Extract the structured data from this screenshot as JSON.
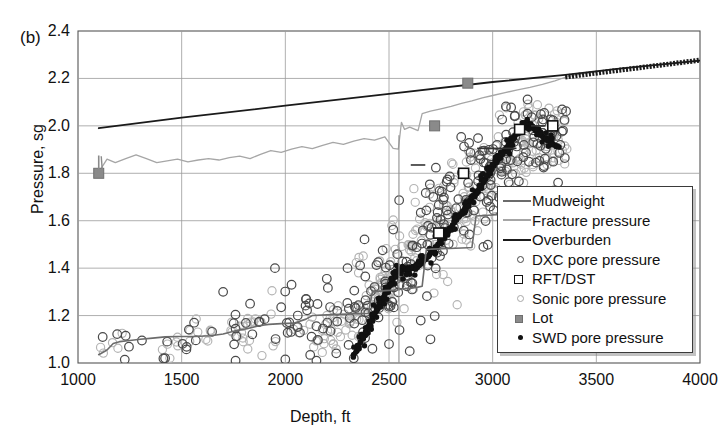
{
  "panel": {
    "label": "(b)"
  },
  "chart_data": {
    "type": "scatter",
    "title": "",
    "xlabel": "Depth, ft",
    "ylabel": "Pressure, sg",
    "xlim": [
      1000,
      4000
    ],
    "ylim": [
      1.0,
      2.4
    ],
    "xticks": [
      1000,
      1500,
      2000,
      2500,
      3000,
      3500,
      4000
    ],
    "yticks": [
      "1.0",
      "1.2",
      "1.4",
      "1.6",
      "1.8",
      "2.0",
      "2.2",
      "2.4"
    ],
    "grid": true,
    "legend_position": "center-right",
    "legend": [
      {
        "label": "Mudweight",
        "kind": "line",
        "color": "#6b6b6b"
      },
      {
        "label": "Fracture pressure",
        "kind": "line",
        "color": "#a6a6a6"
      },
      {
        "label": "Overburden",
        "kind": "line",
        "color": "#1a1a1a"
      },
      {
        "label": "DXC pore pressure",
        "kind": "open-circle",
        "color": "#444444"
      },
      {
        "label": "RFT/DST",
        "kind": "open-square",
        "color": "#111111"
      },
      {
        "label": "Sonic pore pressure",
        "kind": "open-circle-light",
        "color": "#a8a8a8"
      },
      {
        "label": "Lot",
        "kind": "filled-square",
        "color": "#8a8a8a"
      },
      {
        "label": "SWD pore pressure",
        "kind": "filled-dot",
        "color": "#111111"
      }
    ],
    "series": [
      {
        "name": "Overburden",
        "type": "line",
        "color": "#1a1a1a",
        "points": [
          [
            1100,
            1.99
          ],
          [
            1500,
            2.035
          ],
          [
            2000,
            2.085
          ],
          [
            2500,
            2.135
          ],
          [
            3000,
            2.185
          ],
          [
            3350,
            2.215
          ],
          [
            3600,
            2.24
          ],
          [
            4000,
            2.275
          ]
        ]
      },
      {
        "name": "Fracture pressure",
        "type": "line",
        "color": "#a6a6a6",
        "points": [
          [
            1100,
            1.805
          ],
          [
            1140,
            1.86
          ],
          [
            1180,
            1.845
          ],
          [
            1230,
            1.862
          ],
          [
            1280,
            1.878
          ],
          [
            1330,
            1.862
          ],
          [
            1380,
            1.845
          ],
          [
            1430,
            1.852
          ],
          [
            1480,
            1.86
          ],
          [
            1530,
            1.848
          ],
          [
            1580,
            1.856
          ],
          [
            1630,
            1.862
          ],
          [
            1680,
            1.856
          ],
          [
            1730,
            1.866
          ],
          [
            1780,
            1.872
          ],
          [
            1830,
            1.862
          ],
          [
            1880,
            1.88
          ],
          [
            1930,
            1.896
          ],
          [
            1980,
            1.888
          ],
          [
            2030,
            1.902
          ],
          [
            2080,
            1.912
          ],
          [
            2130,
            1.904
          ],
          [
            2180,
            1.918
          ],
          [
            2230,
            1.93
          ],
          [
            2280,
            1.922
          ],
          [
            2330,
            1.936
          ],
          [
            2380,
            1.946
          ],
          [
            2430,
            1.94
          ],
          [
            2480,
            1.954
          ],
          [
            2520,
            1.905
          ],
          [
            2545,
            1.902
          ],
          [
            2560,
            2.015
          ],
          [
            2575,
            1.985
          ],
          [
            2600,
            1.995
          ],
          [
            2640,
            1.98
          ],
          [
            2660,
            2.052
          ],
          [
            2700,
            2.062
          ],
          [
            2750,
            2.072
          ],
          [
            2800,
            2.082
          ],
          [
            2850,
            2.095
          ],
          [
            2900,
            2.105
          ],
          [
            2950,
            2.118
          ],
          [
            3000,
            2.128
          ],
          [
            3060,
            2.14
          ],
          [
            3120,
            2.152
          ],
          [
            3180,
            2.162
          ],
          [
            3240,
            2.175
          ],
          [
            3300,
            2.19
          ],
          [
            3350,
            2.205
          ],
          [
            3400,
            2.215
          ],
          [
            3500,
            2.228
          ],
          [
            3600,
            2.24
          ],
          [
            3700,
            2.25
          ],
          [
            3800,
            2.258
          ],
          [
            3900,
            2.268
          ],
          [
            4000,
            2.276
          ]
        ]
      },
      {
        "name": "Mudweight",
        "type": "line",
        "color": "#6b6b6b",
        "points": [
          [
            1100,
            1.035
          ],
          [
            1140,
            1.055
          ],
          [
            1170,
            1.082
          ],
          [
            1200,
            1.09
          ],
          [
            1250,
            1.095
          ],
          [
            1300,
            1.1
          ],
          [
            1360,
            1.105
          ],
          [
            1420,
            1.11
          ],
          [
            1480,
            1.112
          ],
          [
            1560,
            1.112
          ],
          [
            1640,
            1.115
          ],
          [
            1700,
            1.122
          ],
          [
            1760,
            1.136
          ],
          [
            1800,
            1.142
          ],
          [
            1840,
            1.15
          ],
          [
            1880,
            1.158
          ],
          [
            1920,
            1.163
          ],
          [
            1980,
            1.166
          ],
          [
            2040,
            1.168
          ],
          [
            2100,
            1.185
          ],
          [
            2130,
            1.2
          ],
          [
            2200,
            1.203
          ],
          [
            2260,
            1.205
          ],
          [
            2300,
            1.206
          ],
          [
            2350,
            1.208
          ],
          [
            2400,
            1.209
          ],
          [
            2420,
            1.3
          ],
          [
            2480,
            1.305
          ],
          [
            2540,
            1.308
          ],
          [
            2560,
            1.312
          ],
          [
            2600,
            1.314
          ],
          [
            2640,
            1.32
          ],
          [
            2660,
            1.324
          ],
          [
            2680,
            1.478
          ],
          [
            2700,
            1.48
          ],
          [
            2760,
            1.482
          ],
          [
            2820,
            1.484
          ],
          [
            2880,
            1.486
          ],
          [
            2900,
            1.487
          ],
          [
            2920,
            1.62
          ],
          [
            2960,
            1.622
          ],
          [
            3000,
            1.624
          ],
          [
            3040,
            1.626
          ],
          [
            3080,
            1.628
          ],
          [
            3120,
            1.63
          ],
          [
            3160,
            1.632
          ],
          [
            3200,
            1.633
          ],
          [
            3240,
            1.634
          ],
          [
            3280,
            1.636
          ],
          [
            3320,
            1.637
          ]
        ]
      },
      {
        "name": "Lot",
        "type": "filled-square",
        "color": "#8a8a8a",
        "points": [
          [
            1100,
            1.8
          ],
          [
            2720,
            2.0
          ],
          [
            2880,
            2.18
          ]
        ]
      },
      {
        "name": "RFT/DST",
        "type": "open-square",
        "color": "#111111",
        "points": [
          [
            2740,
            1.548
          ],
          [
            2860,
            1.8
          ],
          [
            3130,
            1.985
          ],
          [
            3290,
            2.0
          ]
        ]
      },
      {
        "name": "SWD pore pressure",
        "type": "filled-dot",
        "color": "#111111",
        "points": [
          [
            2330,
            1.035
          ],
          [
            2345,
            1.052
          ],
          [
            2355,
            1.07
          ],
          [
            2362,
            1.088
          ],
          [
            2370,
            1.105
          ],
          [
            2380,
            1.118
          ],
          [
            2390,
            1.132
          ],
          [
            2398,
            1.148
          ],
          [
            2405,
            1.162
          ],
          [
            2415,
            1.178
          ],
          [
            2422,
            1.192
          ],
          [
            2430,
            1.205
          ],
          [
            2438,
            1.218
          ],
          [
            2446,
            1.228
          ],
          [
            2452,
            1.24
          ],
          [
            2460,
            1.252
          ],
          [
            2468,
            1.265
          ],
          [
            2476,
            1.28
          ],
          [
            2484,
            1.295
          ],
          [
            2492,
            1.31
          ],
          [
            2500,
            1.322
          ],
          [
            2508,
            1.335
          ],
          [
            2516,
            1.348
          ],
          [
            2522,
            1.36
          ],
          [
            2530,
            1.372
          ],
          [
            2538,
            1.385
          ],
          [
            2546,
            1.392
          ],
          [
            2556,
            1.386
          ],
          [
            2566,
            1.392
          ],
          [
            2576,
            1.4
          ],
          [
            2586,
            1.395
          ],
          [
            2596,
            1.39
          ],
          [
            2606,
            1.398
          ],
          [
            2616,
            1.406
          ],
          [
            2626,
            1.398
          ],
          [
            2636,
            1.404
          ],
          [
            2646,
            1.412
          ],
          [
            2656,
            1.42
          ],
          [
            2666,
            1.43
          ],
          [
            2676,
            1.438
          ],
          [
            2686,
            1.448
          ],
          [
            2696,
            1.458
          ],
          [
            2706,
            1.468
          ],
          [
            2716,
            1.478
          ],
          [
            2726,
            1.488
          ],
          [
            2736,
            1.5
          ],
          [
            2746,
            1.512
          ],
          [
            2756,
            1.522
          ],
          [
            2766,
            1.534
          ],
          [
            2776,
            1.545
          ],
          [
            2786,
            1.556
          ],
          [
            2796,
            1.568
          ],
          [
            2806,
            1.58
          ],
          [
            2816,
            1.592
          ],
          [
            2826,
            1.604
          ],
          [
            2836,
            1.616
          ],
          [
            2846,
            1.628
          ],
          [
            2856,
            1.64
          ],
          [
            2866,
            1.652
          ],
          [
            2876,
            1.664
          ],
          [
            2886,
            1.678
          ],
          [
            2896,
            1.69
          ],
          [
            2906,
            1.702
          ],
          [
            2916,
            1.714
          ],
          [
            2926,
            1.726
          ],
          [
            2936,
            1.738
          ],
          [
            2946,
            1.75
          ],
          [
            2956,
            1.762
          ],
          [
            2966,
            1.776
          ],
          [
            2976,
            1.79
          ],
          [
            2986,
            1.804
          ],
          [
            2996,
            1.818
          ],
          [
            3006,
            1.832
          ],
          [
            3016,
            1.846
          ],
          [
            3026,
            1.858
          ],
          [
            3036,
            1.872
          ],
          [
            3046,
            1.884
          ],
          [
            3056,
            1.896
          ],
          [
            3066,
            1.908
          ],
          [
            3076,
            1.92
          ],
          [
            3086,
            1.932
          ],
          [
            3096,
            1.944
          ],
          [
            3106,
            1.956
          ],
          [
            3116,
            1.966
          ],
          [
            3126,
            1.976
          ],
          [
            3136,
            1.986
          ],
          [
            3146,
            1.996
          ],
          [
            3156,
            2.004
          ],
          [
            3166,
            2.01
          ],
          [
            3176,
            2.006
          ],
          [
            3186,
            1.998
          ],
          [
            3196,
            1.99
          ],
          [
            3206,
            1.982
          ],
          [
            3216,
            1.974
          ],
          [
            3226,
            1.966
          ],
          [
            3236,
            1.958
          ],
          [
            3246,
            1.95
          ],
          [
            3256,
            1.944
          ],
          [
            3266,
            1.938
          ],
          [
            3276,
            1.932
          ],
          [
            3286,
            1.926
          ],
          [
            3296,
            1.92
          ],
          [
            3306,
            1.914
          ]
        ]
      },
      {
        "name": "DXC pore pressure",
        "type": "open-circle",
        "color": "#444444",
        "note": "Broad scatter cloud rising from ~1.0-1.2 sg at 1100-2300 ft to ~1.8-2.1 sg at 3000-3350 ft"
      },
      {
        "name": "Sonic pore pressure",
        "type": "open-circle-light",
        "color": "#a8a8a8",
        "note": "Dense light scatter overlapping the DXC cloud, heaviest between 2400 and 3350 ft"
      }
    ]
  }
}
